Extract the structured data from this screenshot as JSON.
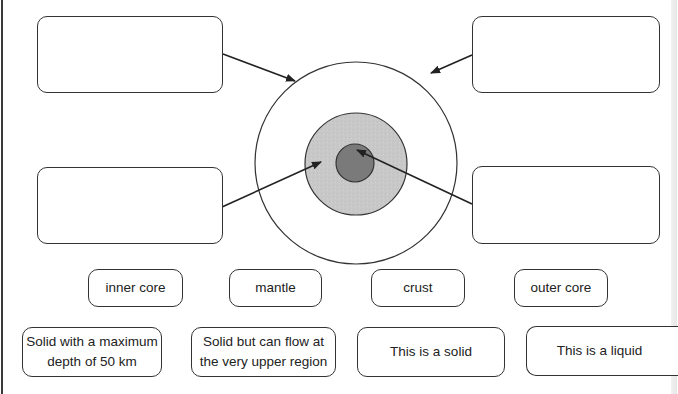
{
  "diagram": {
    "type": "earth-layers-labeling-worksheet",
    "layers": [
      {
        "name": "outer-ring",
        "fill": "#ffffff"
      },
      {
        "name": "middle-ring",
        "fill": "#c8c8c8"
      },
      {
        "name": "center",
        "fill": "#7a7a7a"
      }
    ],
    "answer_boxes": [
      {
        "id": "top-left",
        "value": ""
      },
      {
        "id": "top-right",
        "value": ""
      },
      {
        "id": "bottom-left",
        "value": ""
      },
      {
        "id": "bottom-right",
        "value": ""
      }
    ]
  },
  "layer_labels": [
    {
      "label": "inner core"
    },
    {
      "label": "mantle"
    },
    {
      "label": "crust"
    },
    {
      "label": "outer core"
    }
  ],
  "descriptions": [
    {
      "line1": "Solid with a maximum",
      "line2": "depth of 50 km"
    },
    {
      "line1": "Solid but can flow at",
      "line2": "the very upper region"
    },
    {
      "line1": "This is a solid",
      "line2": ""
    },
    {
      "line1": "This is a liquid",
      "line2": ""
    }
  ],
  "colors": {
    "stroke": "#333333",
    "middle_fill": "#c8c8c8",
    "core_fill": "#7a7a7a"
  }
}
